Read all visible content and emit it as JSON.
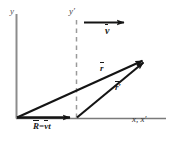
{
  "figure": {
    "axes": {
      "y_label": "y",
      "y_prime_label": "y′",
      "x_label": "x, x′",
      "axis_color": "#8c8c8c",
      "x_axis_color": "#7a7a7a"
    },
    "vectors": [
      {
        "name": "R",
        "label_base": "R",
        "label_rel": "=",
        "label_v": "v",
        "label_t": "t",
        "full_label": "R=vt",
        "color": "#141414",
        "from": [
          16,
          118
        ],
        "to": [
          76,
          118
        ]
      },
      {
        "name": "r",
        "label": "r",
        "color": "#141414",
        "from": [
          16,
          118
        ],
        "to": [
          148,
          58
        ]
      },
      {
        "name": "r-prime",
        "label": "r′",
        "color": "#141414",
        "from": [
          76,
          118
        ],
        "to": [
          148,
          58
        ]
      },
      {
        "name": "v",
        "label": "v",
        "color": "#141414",
        "from": [
          84,
          22
        ],
        "to": [
          128,
          22
        ]
      }
    ],
    "dashed_line": {
      "name": "y-prime-axis",
      "color": "#9a9a9a",
      "from": [
        76,
        20
      ],
      "to": [
        76,
        118
      ]
    }
  }
}
